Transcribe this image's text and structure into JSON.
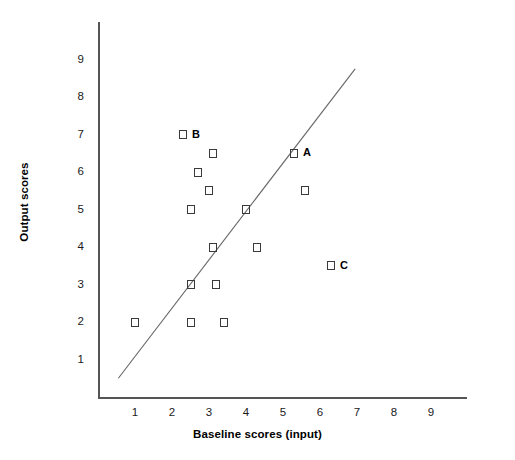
{
  "chart_data": {
    "type": "scatter",
    "title": "",
    "xlabel": "Baseline scores (input)",
    "ylabel": "Output scores",
    "xlim": [
      0,
      9.9
    ],
    "ylim": [
      0,
      9.9
    ],
    "xticks": [
      "1",
      "2",
      "3",
      "4",
      "5",
      "6",
      "7",
      "8",
      "9"
    ],
    "yticks": [
      "1",
      "2",
      "3",
      "4",
      "5",
      "6",
      "7",
      "8",
      "9"
    ],
    "grid": false,
    "legend": "none",
    "points": [
      {
        "x": 1.0,
        "y": 2.0,
        "label": ""
      },
      {
        "x": 2.3,
        "y": 7.0,
        "label": "B"
      },
      {
        "x": 2.5,
        "y": 5.0,
        "label": ""
      },
      {
        "x": 2.5,
        "y": 2.0,
        "label": ""
      },
      {
        "x": 2.5,
        "y": 3.0,
        "label": ""
      },
      {
        "x": 2.7,
        "y": 6.0,
        "label": ""
      },
      {
        "x": 3.1,
        "y": 6.5,
        "label": ""
      },
      {
        "x": 3.1,
        "y": 4.0,
        "label": ""
      },
      {
        "x": 3.2,
        "y": 3.0,
        "label": ""
      },
      {
        "x": 3.0,
        "y": 5.5,
        "label": ""
      },
      {
        "x": 3.4,
        "y": 2.0,
        "label": ""
      },
      {
        "x": 4.0,
        "y": 5.0,
        "label": ""
      },
      {
        "x": 4.3,
        "y": 4.0,
        "label": ""
      },
      {
        "x": 5.3,
        "y": 6.5,
        "label": "A"
      },
      {
        "x": 5.6,
        "y": 5.5,
        "label": ""
      },
      {
        "x": 6.3,
        "y": 3.5,
        "label": "C"
      }
    ],
    "trend_line": {
      "x_start": 0.55,
      "y_start": 0.5,
      "x_end": 6.95,
      "y_end": 8.75,
      "color": "#666666"
    },
    "marker_shape": "open-square",
    "marker_color": "#3a3a3a"
  }
}
